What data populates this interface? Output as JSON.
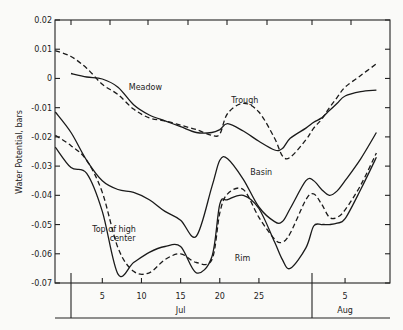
{
  "chart_data": {
    "type": "line",
    "title": "",
    "xlabel": "",
    "ylabel": "Water Potential, bars",
    "ylim": [
      -0.07,
      0.02
    ],
    "yticks": [
      "0.02",
      "0.01",
      "0",
      "-0.01",
      "-0.02",
      "-0.03",
      "-0.04",
      "-0.05",
      "-0.06",
      "-0.07"
    ],
    "xticks": [
      {
        "label": "5",
        "day": 5
      },
      {
        "label": "10",
        "day": 10
      },
      {
        "label": "15",
        "day": 15
      },
      {
        "label": "20",
        "day": 20
      },
      {
        "label": "25",
        "day": 25
      },
      {
        "label": "5",
        "day": 36
      }
    ],
    "month_labels": [
      {
        "label": "Jul",
        "day": 15
      },
      {
        "label": "Aug",
        "day": 36
      }
    ],
    "grid": false,
    "legend": "inline annotations",
    "x_days_note": "day index: July 1 = 1, August d = 31 + d",
    "x": [
      -1,
      1,
      3,
      5,
      7,
      9,
      11,
      13,
      15,
      17,
      19,
      20,
      21,
      23,
      25,
      27,
      28,
      29,
      31,
      32,
      33,
      34,
      35,
      36,
      38,
      40
    ],
    "series": [
      {
        "name": "Meadow",
        "style": "solid",
        "values": [
          null,
          0.0017,
          0.0005,
          -0.0002,
          -0.003,
          -0.009,
          -0.0125,
          -0.0145,
          -0.0165,
          -0.0185,
          -0.0185,
          -0.0175,
          -0.0155,
          -0.018,
          -0.0215,
          -0.0245,
          -0.024,
          -0.0205,
          -0.017,
          -0.015,
          -0.0135,
          -0.011,
          -0.0085,
          -0.006,
          -0.0045,
          -0.004
        ]
      },
      {
        "name": "Trough",
        "style": "dashed",
        "values": [
          0.0095,
          0.0075,
          0.0035,
          -0.002,
          -0.0055,
          -0.0105,
          -0.0135,
          -0.0145,
          -0.016,
          -0.0175,
          -0.0195,
          -0.019,
          -0.012,
          -0.0085,
          -0.0115,
          -0.0205,
          -0.0265,
          -0.027,
          -0.021,
          -0.017,
          -0.014,
          -0.01,
          -0.0065,
          -0.003,
          0.001,
          0.005
        ]
      },
      {
        "name": "Basin",
        "style": "solid",
        "values": [
          -0.0115,
          -0.0185,
          -0.028,
          -0.035,
          -0.038,
          -0.039,
          -0.0415,
          -0.0455,
          -0.0485,
          -0.054,
          -0.037,
          -0.028,
          -0.0275,
          -0.0345,
          -0.044,
          -0.049,
          -0.049,
          -0.0445,
          -0.035,
          -0.035,
          -0.038,
          -0.04,
          -0.0385,
          -0.035,
          -0.0275,
          -0.0185
        ]
      },
      {
        "name": "Top of high center",
        "style": "dashed",
        "values": [
          -0.0195,
          -0.023,
          -0.028,
          -0.039,
          -0.058,
          -0.066,
          -0.0665,
          -0.062,
          -0.06,
          -0.063,
          -0.062,
          -0.046,
          -0.0395,
          -0.038,
          -0.0475,
          -0.055,
          -0.056,
          -0.053,
          -0.0415,
          -0.0395,
          -0.043,
          -0.0475,
          -0.0475,
          -0.045,
          -0.0365,
          -0.0255
        ]
      },
      {
        "name": "Top of high center (solid)",
        "style": "solid",
        "values": [
          -0.0235,
          -0.0305,
          -0.0325,
          -0.0455,
          -0.067,
          -0.063,
          -0.0595,
          -0.0575,
          -0.0575,
          -0.0665,
          -0.061,
          -0.043,
          -0.0415,
          -0.04,
          -0.0445,
          -0.056,
          -0.062,
          -0.065,
          -0.058,
          -0.0505,
          -0.05,
          -0.05,
          -0.0495,
          -0.048,
          -0.038,
          -0.027
        ]
      },
      {
        "name": "Rim",
        "style": "solid",
        "values": [
          null,
          null,
          null,
          null,
          null,
          null,
          null,
          null,
          null,
          null,
          null,
          null,
          null,
          null,
          null,
          null,
          null,
          null,
          null,
          null,
          null,
          null,
          null,
          null,
          null,
          null
        ]
      }
    ],
    "annotations": [
      {
        "text": "Meadow",
        "day": 10.5,
        "value": -0.004
      },
      {
        "text": "Trough",
        "day": 23.2,
        "value": -0.0085
      },
      {
        "text": "Basin",
        "day": 25.3,
        "value": -0.033
      },
      {
        "text": "Top of high",
        "day": 6.5,
        "value": -0.0525
      },
      {
        "text": "center",
        "day": 7.6,
        "value": -0.0555
      },
      {
        "text": "Rim",
        "day": 22.9,
        "value": -0.0625
      }
    ]
  }
}
